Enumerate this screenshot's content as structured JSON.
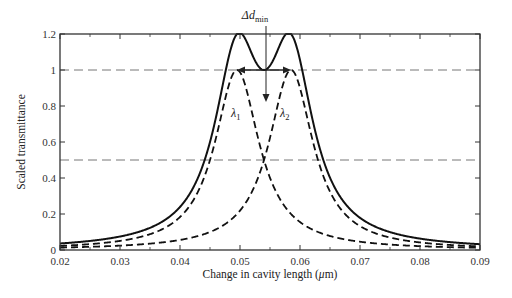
{
  "chart_data": {
    "type": "line",
    "title": "",
    "xlabel": "Change in cavity length (μm)",
    "ylabel": "Scaled transmittance",
    "xlim": [
      0.02,
      0.09
    ],
    "ylim": [
      0,
      1.2
    ],
    "x_ticks": [
      0.02,
      0.03,
      0.04,
      0.05,
      0.06,
      0.07,
      0.08,
      0.09
    ],
    "x_tick_labels": [
      "0.02",
      "0.03",
      "0.04",
      "0.05",
      "0.06",
      "0.07",
      "0.08",
      "0.09"
    ],
    "y_ticks": [
      0,
      0.2,
      0.4,
      0.6,
      0.8,
      1,
      1.2
    ],
    "y_tick_labels": [
      "0",
      "0.2",
      "0.4",
      "0.6",
      "0.8",
      "1",
      "1.2"
    ],
    "grid": false,
    "reference_lines": [
      {
        "orientation": "horizontal",
        "y": 1.0,
        "style": "dashed",
        "color": "#777777"
      },
      {
        "orientation": "horizontal",
        "y": 0.5,
        "style": "dashed",
        "color": "#777777"
      }
    ],
    "series": [
      {
        "name": "λ1",
        "style": "dashed",
        "shape": "lorentzian",
        "center": 0.0495,
        "hwhm": 0.0045,
        "peak": 1.0,
        "x": [
          0.02,
          0.03,
          0.04,
          0.045,
          0.0495,
          0.054,
          0.06,
          0.07,
          0.08,
          0.09
        ],
        "values": [
          0.02,
          0.05,
          0.18,
          0.5,
          1.0,
          0.5,
          0.16,
          0.05,
          0.02,
          0.01
        ]
      },
      {
        "name": "λ2",
        "style": "dashed",
        "shape": "lorentzian",
        "center": 0.0585,
        "hwhm": 0.0045,
        "peak": 1.0,
        "x": [
          0.02,
          0.03,
          0.04,
          0.05,
          0.054,
          0.0585,
          0.063,
          0.07,
          0.08,
          0.09
        ],
        "values": [
          0.01,
          0.02,
          0.06,
          0.22,
          0.5,
          1.0,
          0.5,
          0.13,
          0.04,
          0.02
        ]
      },
      {
        "name": "Sum",
        "style": "solid",
        "shape": "sum of λ1 and λ2",
        "x": [
          0.02,
          0.03,
          0.04,
          0.045,
          0.0495,
          0.054,
          0.0585,
          0.063,
          0.07,
          0.08,
          0.09
        ],
        "values": [
          0.03,
          0.07,
          0.24,
          0.58,
          1.2,
          1.0,
          1.2,
          0.58,
          0.18,
          0.06,
          0.03
        ]
      }
    ],
    "annotations": [
      {
        "text": "λ1",
        "x": 0.0475,
        "y": 0.76
      },
      {
        "text": "λ2",
        "x": 0.0595,
        "y": 0.76
      },
      {
        "text": "Δd_min",
        "x": 0.0545,
        "y": 1.3,
        "arrow_to": [
          0.0545,
          0.98
        ]
      },
      {
        "text": "double-headed arrow between peaks at y=1",
        "x_from": 0.0495,
        "x_to": 0.0585,
        "y": 1.0
      }
    ],
    "legend": null
  },
  "labels": {
    "ylabel": "Scaled transmittance",
    "xlabel_prefix": "Change in cavity length (",
    "xlabel_mu": "μ",
    "xlabel_suffix": "m)",
    "lambda1_main": "λ",
    "lambda1_sub": "1",
    "lambda2_main": "λ",
    "lambda2_sub": "2",
    "delta_main": "Δd",
    "delta_sub": "min"
  },
  "colors": {
    "curve": "#111111",
    "reference": "#777777",
    "axis": "#333333"
  }
}
